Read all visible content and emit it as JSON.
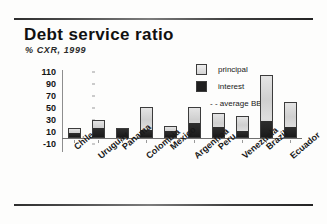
{
  "header": {
    "title": "Debt service ratio",
    "subtitle": "% CXR, 1999"
  },
  "legend": {
    "principal_label": "principal",
    "interest_label": "interest",
    "average_label": "- - average BBB"
  },
  "chart_data": {
    "type": "bar",
    "stacked": true,
    "title": "Debt service ratio",
    "subtitle": "% CXR, 1999",
    "xlabel": "",
    "ylabel": "",
    "ylim": [
      -10,
      110
    ],
    "yticks": [
      110,
      90,
      70,
      50,
      30,
      10,
      -10
    ],
    "grid": false,
    "legend_position": "top-right",
    "categories": [
      "Chile",
      "Uruguay",
      "Panama",
      "Colombia",
      "Mexico",
      "Argentina",
      "Peru",
      "Venezuela",
      "Brazil",
      "Ecuador"
    ],
    "series": [
      {
        "name": "interest",
        "color": "#232323",
        "values": [
          9,
          16,
          16,
          13,
          12,
          25,
          18,
          11,
          27,
          18
        ]
      },
      {
        "name": "principal",
        "color": "#d6d6d6",
        "values": [
          8,
          14,
          0,
          39,
          8,
          27,
          24,
          26,
          78,
          42
        ]
      }
    ],
    "totals": [
      17,
      30,
      16,
      52,
      20,
      52,
      42,
      37,
      105,
      60
    ],
    "annotations": [
      "average BBB"
    ]
  }
}
